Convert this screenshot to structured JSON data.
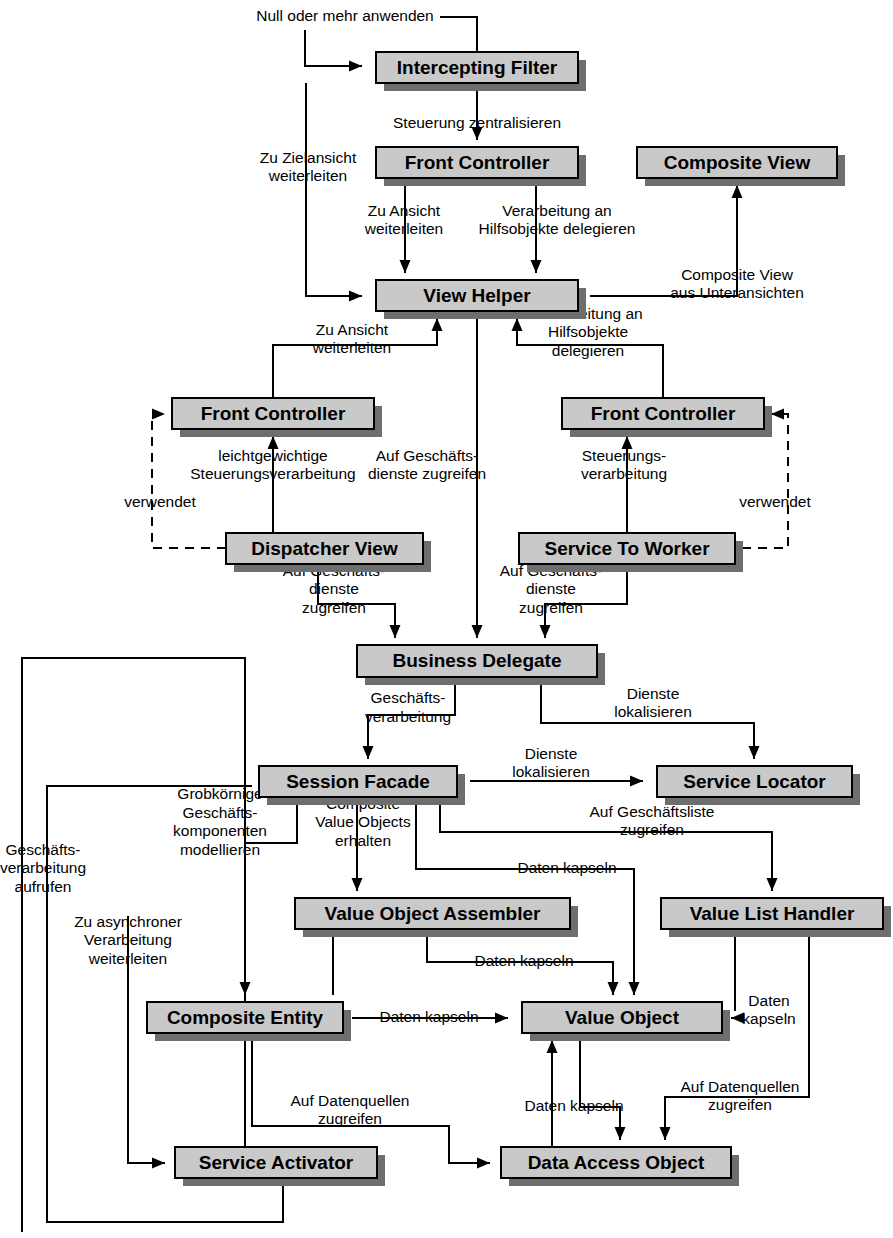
{
  "diagram": {
    "language": "de",
    "colors": {
      "box_fill": "#c9c9c9",
      "box_stroke": "#000000",
      "box_shadow": "#6e6e6e",
      "edge": "#000000",
      "background": "#ffffff"
    },
    "nodes": [
      {
        "id": "intercepting-filter",
        "label": "Intercepting Filter",
        "x": 376,
        "y": 52,
        "w": 202,
        "h": 31
      },
      {
        "id": "front-controller-top",
        "label": "Front Controller",
        "x": 376,
        "y": 147,
        "w": 202,
        "h": 31
      },
      {
        "id": "composite-view",
        "label": "Composite View",
        "x": 637,
        "y": 147,
        "w": 200,
        "h": 31
      },
      {
        "id": "view-helper",
        "label": "View Helper",
        "x": 376,
        "y": 280,
        "w": 202,
        "h": 31
      },
      {
        "id": "front-controller-left",
        "label": "Front Controller",
        "x": 172,
        "y": 398,
        "w": 202,
        "h": 31
      },
      {
        "id": "front-controller-right",
        "label": "Front Controller",
        "x": 562,
        "y": 398,
        "w": 202,
        "h": 31
      },
      {
        "id": "dispatcher-view",
        "label": "Dispatcher View",
        "x": 226,
        "y": 533,
        "w": 197,
        "h": 31
      },
      {
        "id": "service-to-worker",
        "label": "Service To Worker",
        "x": 519,
        "y": 533,
        "w": 216,
        "h": 31
      },
      {
        "id": "business-delegate",
        "label": "Business Delegate",
        "x": 357,
        "y": 645,
        "w": 240,
        "h": 32
      },
      {
        "id": "session-facade",
        "label": "Session Facade",
        "x": 259,
        "y": 766,
        "w": 198,
        "h": 31
      },
      {
        "id": "service-locator",
        "label": "Service Locator",
        "x": 657,
        "y": 766,
        "w": 195,
        "h": 31
      },
      {
        "id": "value-object-assembler",
        "label": "Value Object Assembler",
        "x": 295,
        "y": 898,
        "w": 275,
        "h": 31
      },
      {
        "id": "value-list-handler",
        "label": "Value List Handler",
        "x": 661,
        "y": 898,
        "w": 222,
        "h": 31
      },
      {
        "id": "composite-entity",
        "label": "Composite Entity",
        "x": 147,
        "y": 1002,
        "w": 196,
        "h": 31
      },
      {
        "id": "value-object",
        "label": "Value Object",
        "x": 522,
        "y": 1002,
        "w": 200,
        "h": 31
      },
      {
        "id": "service-activator",
        "label": "Service Activator",
        "x": 175,
        "y": 1147,
        "w": 202,
        "h": 31
      },
      {
        "id": "data-access-object",
        "label": "Data Access Object",
        "x": 501,
        "y": 1147,
        "w": 230,
        "h": 31
      }
    ],
    "edge_labels": [
      {
        "id": "null-oder-mehr-anwenden",
        "lines": [
          "Null oder mehr anwenden"
        ],
        "x": 345,
        "y": 17,
        "align": "middle"
      },
      {
        "id": "steuerung-zentralisieren",
        "lines": [
          "Steuerung zentralisieren"
        ],
        "x": 477,
        "y": 124,
        "align": "middle"
      },
      {
        "id": "zu-zielansicht-weiterleiten",
        "lines": [
          "Zu Zielansicht",
          "weiterleiten"
        ],
        "x": 308,
        "y": 168,
        "align": "middle"
      },
      {
        "id": "zu-ansicht-weiterleiten-top",
        "lines": [
          "Zu Ansicht",
          "weiterleiten"
        ],
        "x": 404,
        "y": 221,
        "align": "middle"
      },
      {
        "id": "verarbeitung-hilfsobjekte-delegieren-top",
        "lines": [
          "Verarbeitung an",
          "Hilfsobjekte delegieren"
        ],
        "x": 557,
        "y": 221,
        "align": "middle"
      },
      {
        "id": "composite-view-aus-unteransichten",
        "lines": [
          "Composite View",
          "aus Unteransichten"
        ],
        "x": 737,
        "y": 285,
        "align": "middle"
      },
      {
        "id": "zu-ansicht-weiterleiten-mid",
        "lines": [
          "Zu Ansicht",
          "weiterleiten"
        ],
        "x": 352,
        "y": 340,
        "align": "middle"
      },
      {
        "id": "verarbeitung-hilfsobjekte-delegieren-mid",
        "lines": [
          "Verarbeitung an",
          "Hilfsobjekte",
          "delegieren"
        ],
        "x": 588,
        "y": 333,
        "align": "middle"
      },
      {
        "id": "leichtgewichtige-steuerungsverarbeitung",
        "lines": [
          "leichtgewichtige",
          "Steuerungsverarbeitung"
        ],
        "x": 273,
        "y": 466,
        "align": "middle"
      },
      {
        "id": "auf-geschaeftsdienste-zugreifen-center",
        "lines": [
          "Auf Geschäfts-",
          "dienste zugreifen"
        ],
        "x": 427,
        "y": 466,
        "align": "middle"
      },
      {
        "id": "steuerungsverarbeitung-right",
        "lines": [
          "Steuerungs-",
          "verarbeitung"
        ],
        "x": 624,
        "y": 466,
        "align": "middle"
      },
      {
        "id": "verwendet-left",
        "lines": [
          "verwendet"
        ],
        "x": 160,
        "y": 503,
        "align": "middle"
      },
      {
        "id": "verwendet-right",
        "lines": [
          "verwendet"
        ],
        "x": 775,
        "y": 503,
        "align": "middle"
      },
      {
        "id": "auf-geschaeftsdienste-zugreifen-left",
        "lines": [
          "Auf Geschäfts-",
          "dienste",
          "zugreifen"
        ],
        "x": 334,
        "y": 590,
        "align": "middle"
      },
      {
        "id": "auf-geschaeftsdienste-zugreifen-right",
        "lines": [
          "Auf Geschäfts-",
          "dienste",
          "zugreifen"
        ],
        "x": 551,
        "y": 590,
        "align": "middle"
      },
      {
        "id": "indirekte-geschaeftsverarbeitung",
        "lines": [
          "indirekte",
          "Geschäfts-",
          "verarbeitung"
        ],
        "x": 408,
        "y": 699,
        "align": "middle"
      },
      {
        "id": "dienste-lokalisieren-upper",
        "lines": [
          "Dienste",
          "lokalisieren"
        ],
        "x": 653,
        "y": 704,
        "align": "middle"
      },
      {
        "id": "dienste-lokalisieren-lower",
        "lines": [
          "Dienste",
          "lokalisieren"
        ],
        "x": 551,
        "y": 764,
        "align": "middle"
      },
      {
        "id": "auf-geschaeftsliste-zugreifen",
        "lines": [
          "Auf Geschäftsliste",
          "zugreifen"
        ],
        "x": 652,
        "y": 822,
        "align": "middle"
      },
      {
        "id": "grobkoernige-geschaeftskomponenten-modellieren",
        "lines": [
          "Grobkörnige",
          "Geschäfts-",
          "komponenten",
          "modellieren"
        ],
        "x": 220,
        "y": 823,
        "align": "middle"
      },
      {
        "id": "composite-value-objects-erhalten",
        "lines": [
          "Composite",
          "Value Objects",
          "erhalten"
        ],
        "x": 363,
        "y": 823,
        "align": "middle"
      },
      {
        "id": "daten-kapseln-sf-vo",
        "lines": [
          "Daten kapseln"
        ],
        "x": 567,
        "y": 869,
        "align": "middle"
      },
      {
        "id": "geschaeftsverarbeitung-aufrufen",
        "lines": [
          "Geschäfts-",
          "verarbeitung",
          "aufrufen"
        ],
        "x": 43,
        "y": 869,
        "align": "middle"
      },
      {
        "id": "zu-asynchroner-verarbeitung-weiterleiten",
        "lines": [
          "Zu asynchroner",
          "Verarbeitung",
          "weiterleiten"
        ],
        "x": 128,
        "y": 941,
        "align": "middle"
      },
      {
        "id": "daten-kapseln-voa-vo",
        "lines": [
          "Daten kapseln"
        ],
        "x": 524,
        "y": 962,
        "align": "middle"
      },
      {
        "id": "daten-kapseln-ce-vo",
        "lines": [
          "Daten kapseln"
        ],
        "x": 429,
        "y": 1018,
        "align": "middle"
      },
      {
        "id": "daten-kapseln-vlh-vo",
        "lines": [
          "Daten",
          "kapseln"
        ],
        "x": 769,
        "y": 1011,
        "align": "middle"
      },
      {
        "id": "auf-datenquellen-zugreifen-left",
        "lines": [
          "Auf Datenquellen",
          "zugreifen"
        ],
        "x": 350,
        "y": 1111,
        "align": "middle"
      },
      {
        "id": "daten-kapseln-dao-vo",
        "lines": [
          "Daten kapseln"
        ],
        "x": 574,
        "y": 1107,
        "align": "middle"
      },
      {
        "id": "auf-datenquellen-zugreifen-right",
        "lines": [
          "Auf Datenquellen",
          "zugreifen"
        ],
        "x": 740,
        "y": 1097,
        "align": "middle"
      }
    ],
    "edges": [
      {
        "id": "null-anwenden-to-if",
        "from": "label",
        "to": "intercepting-filter",
        "style": "solid",
        "d": "M 305 30 L 305 66 L 362 66",
        "arrow": "right-at-end"
      },
      {
        "id": "if-self-loop-top",
        "from": "intercepting-filter",
        "to": "intercepting-filter",
        "style": "solid",
        "d": "M 477 52 L 477 17 L 440 17",
        "arrow": "none"
      },
      {
        "id": "if-to-fc-top",
        "from": "intercepting-filter",
        "to": "front-controller-top",
        "style": "solid",
        "d": "M 477 83 L 477 140",
        "arrow": "down-at-end"
      },
      {
        "id": "if-to-view-helper",
        "from": "intercepting-filter",
        "to": "view-helper",
        "style": "solid",
        "d": "M 306 83 L 306 296 L 362 296",
        "arrow": "right-at-end"
      },
      {
        "id": "fc-to-vh-left",
        "from": "front-controller-top",
        "to": "view-helper",
        "style": "solid",
        "d": "M 405 178 L 405 273",
        "arrow": "down-at-end"
      },
      {
        "id": "fc-to-vh-right",
        "from": "front-controller-top",
        "to": "view-helper",
        "style": "solid",
        "d": "M 536 178 L 536 273",
        "arrow": "down-at-end"
      },
      {
        "id": "vh-to-composite-view",
        "from": "view-helper",
        "to": "composite-view",
        "style": "solid",
        "d": "M 590 296 L 737 296 L 737 185",
        "arrow": "up-at-end"
      },
      {
        "id": "fc-left-to-vh",
        "from": "front-controller-left",
        "to": "view-helper",
        "style": "solid",
        "d": "M 273 398 L 273 345 L 437 345 L 437 318",
        "arrow": "up-at-end"
      },
      {
        "id": "fc-right-to-vh",
        "from": "front-controller-right",
        "to": "view-helper",
        "style": "solid",
        "d": "M 663 398 L 663 345 L 517 345 L 517 318",
        "arrow": "up-at-end"
      },
      {
        "id": "dispatcher-to-fc-left",
        "from": "dispatcher-view",
        "to": "front-controller-left",
        "style": "solid",
        "d": "M 273 533 L 273 436",
        "arrow": "up-at-end"
      },
      {
        "id": "stw-to-fc-right",
        "from": "service-to-worker",
        "to": "front-controller-right",
        "style": "solid",
        "d": "M 627 533 L 627 436",
        "arrow": "up-at-end"
      },
      {
        "id": "dispatcher-uses-fc",
        "from": "dispatcher-view",
        "to": "front-controller-left",
        "style": "dashed",
        "d": "M 226 548 L 152 548 L 152 414 L 165 414",
        "arrow": "right-at-end"
      },
      {
        "id": "stw-uses-fc",
        "from": "service-to-worker",
        "to": "front-controller-right",
        "style": "dashed",
        "d": "M 742 548 L 788 548 L 788 414 L 771 414",
        "arrow": "left-at-end"
      },
      {
        "id": "dispatcher-to-bd",
        "from": "dispatcher-view",
        "to": "business-delegate",
        "style": "solid",
        "d": "M 318 564 L 318 604 L 395 604 L 395 638",
        "arrow": "down-at-end"
      },
      {
        "id": "stw-to-bd",
        "from": "service-to-worker",
        "to": "business-delegate",
        "style": "solid",
        "d": "M 627 564 L 627 604 L 545 604 L 545 638",
        "arrow": "down-at-end"
      },
      {
        "id": "vh-to-bd",
        "from": "view-helper",
        "to": "business-delegate",
        "style": "solid",
        "d": "M 477 318 L 477 638",
        "arrow": "down-at-end"
      },
      {
        "id": "bd-to-session-facade",
        "from": "business-delegate",
        "to": "session-facade",
        "style": "solid",
        "d": "M 455 677 L 455 715 L 368 715 L 368 759",
        "arrow": "down-at-end"
      },
      {
        "id": "bd-to-service-locator",
        "from": "business-delegate",
        "to": "service-locator",
        "style": "solid",
        "d": "M 541 677 L 541 723 L 754 723 L 754 759",
        "arrow": "down-at-end"
      },
      {
        "id": "sf-to-service-locator",
        "from": "session-facade",
        "to": "service-locator",
        "style": "solid",
        "d": "M 470 781 L 643 781",
        "arrow": "right-at-end"
      },
      {
        "id": "geschaeftsverarbeitung-loop",
        "from": "service-activator",
        "to": "session-facade",
        "style": "solid",
        "d": "M 283 1178 L 283 1222 L 47 1222 L 47 786 L 252 786",
        "arrow": "none"
      },
      {
        "id": "sf-to-composite-entity",
        "from": "session-facade",
        "to": "composite-entity",
        "style": "solid",
        "d": "M 297 797 L 297 843 L 245 843 L 245 995",
        "arrow": "down-at-end"
      },
      {
        "id": "sf-to-voa",
        "from": "session-facade",
        "to": "value-object-assembler",
        "style": "solid",
        "d": "M 357 797 L 357 891",
        "arrow": "down-at-end"
      },
      {
        "id": "sf-to-value-object",
        "from": "session-facade",
        "to": "value-object",
        "style": "solid",
        "d": "M 416 797 L 416 869 L 634 869 L 634 995",
        "arrow": "down-at-end"
      },
      {
        "id": "sf-to-vlh",
        "from": "session-facade",
        "to": "value-list-handler",
        "style": "solid",
        "d": "M 440 797 L 440 832 L 772 832 L 772 891",
        "arrow": "down-at-end"
      },
      {
        "id": "voa-to-value-object",
        "from": "value-object-assembler",
        "to": "value-object",
        "style": "solid",
        "d": "M 427 929 L 427 962 L 613 962 L 613 995",
        "arrow": "down-at-end"
      },
      {
        "id": "voa-down",
        "from": "value-object-assembler",
        "to": "value-object",
        "style": "solid",
        "d": "M 333 929 L 333 995",
        "arrow": "none"
      },
      {
        "id": "ce-to-value-object",
        "from": "composite-entity",
        "to": "value-object",
        "style": "solid",
        "d": "M 352 1018 L 508 1018",
        "arrow": "right-at-end"
      },
      {
        "id": "vlh-to-value-object",
        "from": "value-list-handler",
        "to": "value-object",
        "style": "solid",
        "d": "M 735 1018 L 731 1018",
        "arrow": "left-at-end"
      },
      {
        "id": "vlh-down",
        "from": "value-list-handler",
        "to": "value-object",
        "style": "solid",
        "d": "M 735 929 L 735 1011",
        "arrow": "none"
      },
      {
        "id": "zu-asynchroner-to-sa",
        "from": "session-facade",
        "to": "service-activator",
        "style": "solid",
        "d": "M 128 916 L 128 1163 L 165 1163",
        "arrow": "right-at-end"
      },
      {
        "id": "ce-to-dao",
        "from": "composite-entity",
        "to": "data-access-object",
        "style": "solid",
        "d": "M 252 1033 L 252 1126 L 449 1126 L 449 1163 L 490 1163",
        "arrow": "right-at-end"
      },
      {
        "id": "vo-to-dao",
        "from": "value-object",
        "to": "data-access-object",
        "style": "solid",
        "d": "M 580 1033 L 580 1107 L 620 1107 L 620 1140",
        "arrow": "down-at-end"
      },
      {
        "id": "dao-to-vo",
        "from": "data-access-object",
        "to": "value-object",
        "style": "solid",
        "d": "M 552 1147 L 552 1040",
        "arrow": "up-at-end"
      },
      {
        "id": "vlh-to-dao",
        "from": "value-list-handler",
        "to": "data-access-object",
        "style": "solid",
        "d": "M 809 929 L 809 1097 L 665 1097 L 665 1140",
        "arrow": "down-at-end"
      },
      {
        "id": "sa-loop",
        "from": "service-activator",
        "to": "business-delegate",
        "style": "solid",
        "d": "M 245 1147 L 245 658 L 22 658 L 22 1232",
        "arrow": "none"
      }
    ]
  }
}
